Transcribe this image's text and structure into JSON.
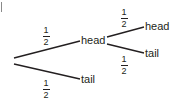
{
  "diagram": {
    "type": "probability-tree",
    "root": {
      "branches": [
        {
          "probability": {
            "numerator": "1",
            "denominator": "2"
          },
          "outcome": "head",
          "branches": [
            {
              "probability": {
                "numerator": "1",
                "denominator": "2"
              },
              "outcome": "head"
            },
            {
              "probability": {
                "numerator": "1",
                "denominator": "2"
              },
              "outcome": "tail"
            }
          ]
        },
        {
          "probability": {
            "numerator": "1",
            "denominator": "2"
          },
          "outcome": "tail"
        }
      ]
    },
    "colors": {
      "line": "#231f20",
      "text": "#231f20",
      "background": "#ffffff"
    }
  }
}
